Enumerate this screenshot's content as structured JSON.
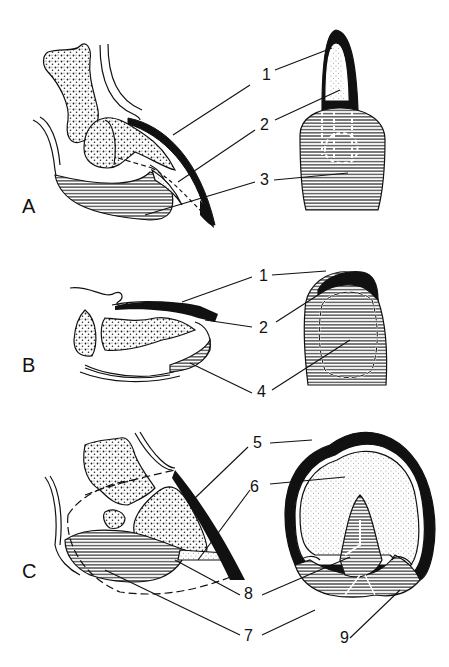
{
  "figure": {
    "panels": [
      {
        "id": "A",
        "label": "A"
      },
      {
        "id": "B",
        "label": "B"
      },
      {
        "id": "C",
        "label": "C"
      }
    ],
    "callouts": {
      "a1": "1",
      "a2": "2",
      "a3": "3",
      "b1": "1",
      "b2": "2",
      "b4": "4",
      "c5": "5",
      "c6": "6",
      "c8": "8",
      "c7": "7",
      "c9": "9"
    },
    "colors": {
      "ink": "#111111",
      "bone_fill": "#ffffff",
      "sole_fill": "#f4f4f4",
      "background": "#ffffff"
    }
  }
}
